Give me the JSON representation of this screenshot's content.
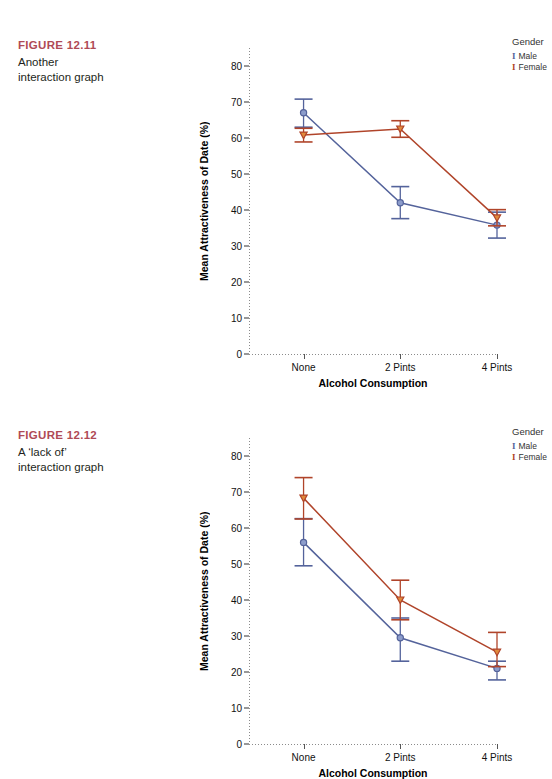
{
  "figures": [
    {
      "caption_title": "FIGURE 12.11",
      "caption_lines": [
        "Another",
        "interaction graph"
      ],
      "legend": {
        "title": "Gender",
        "items": [
          {
            "label": "Male",
            "color": "#54639b",
            "key": "I"
          },
          {
            "label": "Female",
            "color": "#b0442a",
            "key": "I"
          }
        ]
      },
      "chart_data": {
        "type": "line",
        "title": "",
        "xlabel": "Alcohol Consumption",
        "ylabel": "Mean Attractiveness of Date (%)",
        "categories": [
          "None",
          "2 Pints",
          "4 Pints"
        ],
        "ylim": [
          0,
          85
        ],
        "yticks": [
          0,
          10,
          20,
          30,
          40,
          50,
          60,
          70,
          80
        ],
        "grid": false,
        "legend_position": "right",
        "series": [
          {
            "name": "Male",
            "color": "#54639b",
            "marker": "circle",
            "values": [
              67.0,
              42.0,
              35.8
            ],
            "error_low": [
              63.0,
              37.6,
              32.2
            ],
            "error_high": [
              70.8,
              46.5,
              39.4
            ]
          },
          {
            "name": "Female",
            "color": "#b0442a",
            "marker": "triangle-down",
            "values": [
              60.8,
              62.5,
              37.8
            ],
            "error_low": [
              58.9,
              60.2,
              35.6
            ],
            "error_high": [
              62.7,
              64.8,
              40.1
            ]
          }
        ]
      }
    },
    {
      "caption_title": "FIGURE 12.12",
      "caption_lines": [
        "A ‘lack of’",
        "interaction graph"
      ],
      "legend": {
        "title": "Gender",
        "items": [
          {
            "label": "Male",
            "color": "#54639b",
            "key": "I"
          },
          {
            "label": "Female",
            "color": "#b0442a",
            "key": "I"
          }
        ]
      },
      "chart_data": {
        "type": "line",
        "title": "",
        "xlabel": "Alcohol Consumption",
        "ylabel": "Mean Attractiveness of Date (%)",
        "categories": [
          "None",
          "2 Pints",
          "4 Pints"
        ],
        "ylim": [
          0,
          85
        ],
        "yticks": [
          0,
          10,
          20,
          30,
          40,
          50,
          60,
          70,
          80
        ],
        "grid": false,
        "legend_position": "right",
        "series": [
          {
            "name": "Male",
            "color": "#54639b",
            "marker": "circle",
            "values": [
              56.0,
              29.5,
              21.0
            ],
            "error_low": [
              49.5,
              23.0,
              17.8
            ],
            "error_high": [
              62.6,
              35.0,
              23.0
            ]
          },
          {
            "name": "Female",
            "color": "#b0442a",
            "marker": "triangle-down",
            "values": [
              68.3,
              40.0,
              25.5
            ],
            "error_low": [
              62.5,
              34.5,
              21.5
            ],
            "error_high": [
              74.0,
              45.5,
              31.0
            ]
          }
        ]
      }
    }
  ]
}
